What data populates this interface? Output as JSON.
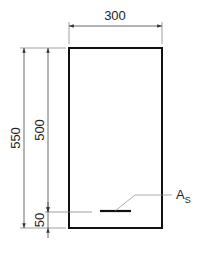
{
  "diagram": {
    "type": "beam-cross-section",
    "dimensions": {
      "width": "300",
      "total_height": "550",
      "effective_depth": "500",
      "cover": "50"
    },
    "labels": {
      "reinforcement": "A",
      "reinforcement_subscript": "S"
    },
    "colors": {
      "outline": "#111111",
      "dimension_lines": "#555555",
      "leader": "#888888"
    }
  }
}
